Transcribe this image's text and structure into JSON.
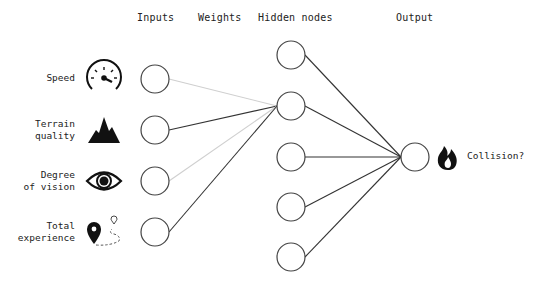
{
  "headers": {
    "inputs": "Inputs",
    "weights": "Weights",
    "hidden": "Hidden nodes",
    "output": "Output"
  },
  "inputs": [
    {
      "label_line1": "Speed",
      "label_line2": "",
      "icon": "speedometer-icon"
    },
    {
      "label_line1": "Terrain",
      "label_line2": "quality",
      "icon": "mountain-icon"
    },
    {
      "label_line1": "Degree",
      "label_line2": "of vision",
      "icon": "eye-icon"
    },
    {
      "label_line1": "Total",
      "label_line2": "experience",
      "icon": "map-route-icon"
    }
  ],
  "hidden_node_count": 5,
  "output": {
    "label": "Collision?",
    "icon": "fire-icon"
  },
  "colors": {
    "strong_edge": "#333333",
    "weak_edge": "#cfcfcf",
    "node_stroke": "#444444"
  }
}
